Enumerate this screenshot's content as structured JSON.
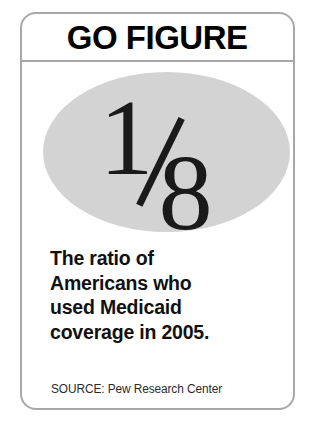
{
  "card": {
    "header": {
      "title": "GO FIGURE"
    },
    "hero": {
      "numerator": "1",
      "slash": "/",
      "denominator": "8",
      "fraction_text": "1/8",
      "ellipse_color": "#d3d3d3",
      "numeral_color": "#1a1a1a"
    },
    "body": {
      "lines": [
        "The ratio of",
        "Americans who",
        "used Medicaid",
        "coverage in 2005."
      ],
      "full_text": "The ratio of Americans who used Medicaid coverage in 2005."
    },
    "source": {
      "label": "SOURCE: Pew Research Center"
    },
    "colors": {
      "border": "#a8a8a8",
      "background": "#ffffff",
      "text": "#111111"
    }
  }
}
